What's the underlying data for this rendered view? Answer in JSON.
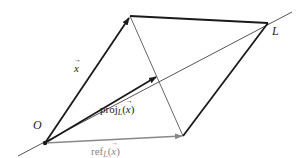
{
  "diagram": {
    "colors": {
      "dark": "#1a1a1a",
      "mid": "#555555",
      "light": "#888888",
      "background": "#ffffff"
    },
    "points": {
      "O": [
        45,
        143
      ],
      "x_tip": [
        130,
        16
      ],
      "L_vertex": [
        268,
        23
      ],
      "ref_tip": [
        183,
        136
      ],
      "proj_tip": [
        157,
        76
      ],
      "line_L_start": [
        18,
        156
      ],
      "line_L_end": [
        292,
        12
      ]
    },
    "labels": {
      "origin": "O",
      "line": "L",
      "x_vector": "x",
      "proj_prefix": "proj",
      "proj_sub": "L",
      "proj_arg_open": "(",
      "proj_arg": "x",
      "proj_arg_close": ")",
      "ref_prefix": "ref",
      "ref_sub": "L",
      "ref_arg_open": "(",
      "ref_arg": "x",
      "ref_arg_close": ")"
    }
  }
}
